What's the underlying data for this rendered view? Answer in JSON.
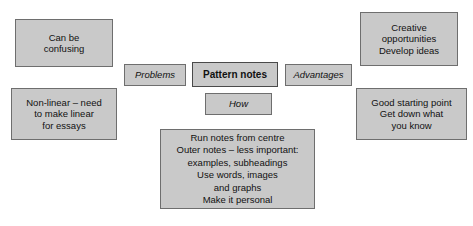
{
  "diagram": {
    "title": "Pattern notes",
    "background_color": "#ffffff",
    "node_fill_color": "#c9c9c9",
    "node_border_color": "#6e6e6e",
    "text_color": "#111111",
    "nodes": {
      "can_be_confusing": {
        "text": "Can be\nconfusing",
        "style": "regular",
        "column": "left"
      },
      "non_linear": {
        "text": "Non-linear – need\nto make linear\nfor essays",
        "style": "regular",
        "column": "left"
      },
      "problems": {
        "text": "Problems",
        "style": "italic",
        "column": "center"
      },
      "pattern_notes": {
        "text": "Pattern notes",
        "style": "bold",
        "column": "center"
      },
      "advantages": {
        "text": "Advantages",
        "style": "italic",
        "column": "center"
      },
      "how": {
        "text": "How",
        "style": "italic",
        "column": "center"
      },
      "detail": {
        "text": "Run notes from centre\nOuter notes – less important:\nexamples, subheadings\nUse words, images\nand graphs\nMake it personal",
        "style": "regular",
        "column": "center"
      },
      "creative": {
        "text": "Creative\nopportunities\nDevelop ideas",
        "style": "regular",
        "column": "right"
      },
      "good_starting_point": {
        "text": "Good starting point\nGet down what\nyou know",
        "style": "regular",
        "column": "right"
      }
    }
  }
}
